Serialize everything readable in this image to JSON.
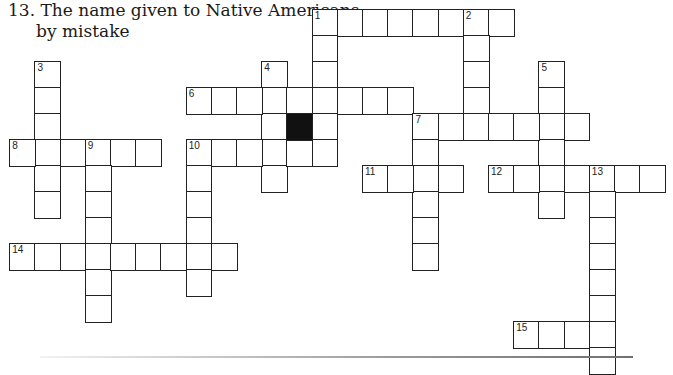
{
  "clue": {
    "number": "13.",
    "line1": "13. The name given to Native Americans",
    "line2": "by mistake"
  },
  "grid": {
    "origin_x": 10,
    "origin_y": 10,
    "cell_w": 25.2,
    "cell_h": 26,
    "words": [
      {
        "num": "1",
        "dir": "across",
        "row": 0,
        "col": 12,
        "len": 8
      },
      {
        "num": "1",
        "dir": "down",
        "row": 0,
        "col": 12,
        "len": 6
      },
      {
        "num": "2",
        "dir": "down",
        "row": 0,
        "col": 18,
        "len": 5
      },
      {
        "num": "3",
        "dir": "down",
        "row": 2,
        "col": 1,
        "len": 6
      },
      {
        "num": "4",
        "dir": "down",
        "row": 2,
        "col": 10,
        "len": 5
      },
      {
        "num": "5",
        "dir": "down",
        "row": 2,
        "col": 21,
        "len": 6
      },
      {
        "num": "6",
        "dir": "across",
        "row": 3,
        "col": 7,
        "len": 9
      },
      {
        "num": "7",
        "dir": "across",
        "row": 4,
        "col": 16,
        "len": 7
      },
      {
        "num": "7",
        "dir": "down",
        "row": 4,
        "col": 16,
        "len": 6
      },
      {
        "num": "8",
        "dir": "across",
        "row": 5,
        "col": 0,
        "len": 6
      },
      {
        "num": "9",
        "dir": "down",
        "row": 5,
        "col": 3,
        "len": 7
      },
      {
        "num": "10",
        "dir": "across",
        "row": 5,
        "col": 7,
        "len": 6
      },
      {
        "num": "10",
        "dir": "down",
        "row": 5,
        "col": 7,
        "len": 6
      },
      {
        "num": "11",
        "dir": "across",
        "row": 6,
        "col": 14,
        "len": 4
      },
      {
        "num": "12",
        "dir": "across",
        "row": 6,
        "col": 19,
        "len": 7
      },
      {
        "num": "13",
        "dir": "down",
        "row": 6,
        "col": 23,
        "len": 8
      },
      {
        "num": "14",
        "dir": "across",
        "row": 9,
        "col": 0,
        "len": 9
      },
      {
        "num": "15",
        "dir": "across",
        "row": 12,
        "col": 20,
        "len": 4
      }
    ],
    "black_cells": [
      {
        "row": 4,
        "col": 11
      }
    ],
    "colors": {
      "line": "#222222",
      "black": "#111111",
      "background": "#ffffff"
    }
  }
}
